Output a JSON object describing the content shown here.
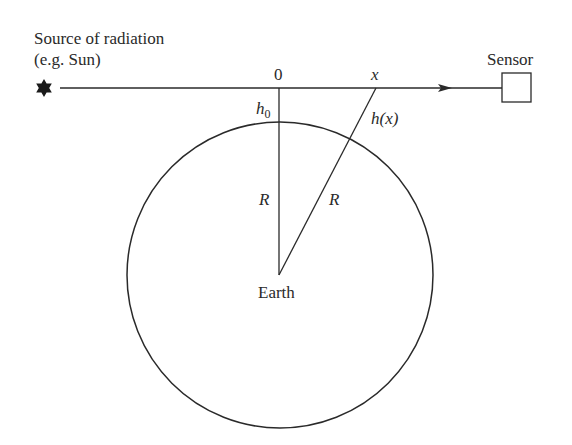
{
  "labels": {
    "source_line1": "Source of radiation",
    "source_line2": "(e.g. Sun)",
    "sensor": "Sensor",
    "origin": "0",
    "x": "x",
    "h0_base": "h",
    "h0_sub": "0",
    "hx": "h(x)",
    "R_left": "R",
    "R_right": "R",
    "earth": "Earth"
  },
  "icons": {
    "source": "six-pointed-star",
    "sensor": "square-box",
    "ray_direction": "arrowhead-right"
  },
  "colors": {
    "line": "#2a2a2a",
    "background": "#ffffff"
  }
}
